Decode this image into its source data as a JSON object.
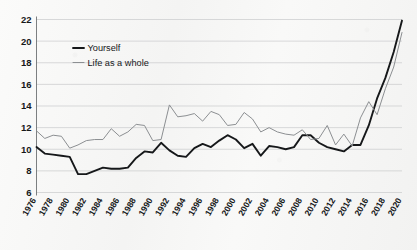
{
  "chart_data": {
    "type": "line",
    "title": "",
    "subtitle": "",
    "xlabel": "",
    "ylabel": "",
    "grid": true,
    "legend_position": "top-left",
    "xlim": [
      1976,
      2020
    ],
    "ylim": [
      6,
      22
    ],
    "yticks": [
      6,
      8,
      10,
      12,
      14,
      16,
      18,
      20,
      22
    ],
    "ytick_labels": [
      "6",
      "8",
      "10",
      "12",
      "14",
      "16",
      "18",
      "20",
      "22"
    ],
    "xticks": [
      1976,
      1978,
      1980,
      1982,
      1984,
      1986,
      1988,
      1990,
      1992,
      1994,
      1996,
      1998,
      2000,
      2002,
      2004,
      2006,
      2008,
      2010,
      2012,
      2014,
      2016,
      2018,
      2020
    ],
    "xtick_labels": [
      "1976",
      "1978",
      "1980",
      "1982",
      "1984",
      "1986",
      "1988",
      "1990",
      "1992",
      "1994",
      "1996",
      "1998",
      "2000",
      "2002",
      "2004",
      "2006",
      "2008",
      "2010",
      "2012",
      "2014",
      "2016",
      "2018",
      "2020"
    ],
    "x": [
      1976,
      1977,
      1978,
      1979,
      1980,
      1981,
      1982,
      1983,
      1984,
      1985,
      1986,
      1987,
      1988,
      1989,
      1990,
      1991,
      1992,
      1993,
      1994,
      1995,
      1996,
      1997,
      1998,
      1999,
      2000,
      2001,
      2002,
      2003,
      2004,
      2005,
      2006,
      2007,
      2008,
      2009,
      2010,
      2011,
      2012,
      2013,
      2014,
      2015,
      2016,
      2017,
      2018,
      2019,
      2020
    ],
    "series": [
      {
        "name": "Yourself",
        "color": "#16181a",
        "width": 1.9,
        "values": [
          10.2,
          9.6,
          9.5,
          9.4,
          9.3,
          7.7,
          7.7,
          8.0,
          8.3,
          8.2,
          8.2,
          8.3,
          9.2,
          9.8,
          9.7,
          10.6,
          9.9,
          9.4,
          9.3,
          10.1,
          10.5,
          10.2,
          10.8,
          11.3,
          10.9,
          10.1,
          10.5,
          9.4,
          10.3,
          10.2,
          10.0,
          10.2,
          11.3,
          11.3,
          10.6,
          10.2,
          10.0,
          9.8,
          10.4,
          10.4,
          12.2,
          14.7,
          16.6,
          19.0,
          21.9
        ]
      },
      {
        "name": "Life as a whole",
        "color": "#8c8f92",
        "width": 1.0,
        "values": [
          11.7,
          11.0,
          11.3,
          11.2,
          10.1,
          10.4,
          10.8,
          10.9,
          10.9,
          11.9,
          11.2,
          11.6,
          12.3,
          12.2,
          10.8,
          10.9,
          14.1,
          13.0,
          13.1,
          13.3,
          12.6,
          13.5,
          13.2,
          12.2,
          12.3,
          13.4,
          12.8,
          11.6,
          12.0,
          11.6,
          11.4,
          11.3,
          11.8,
          10.9,
          11.0,
          12.2,
          10.4,
          11.4,
          10.3,
          12.9,
          14.4,
          13.2,
          15.6,
          17.6,
          20.8
        ]
      }
    ]
  },
  "legend": {
    "entries": [
      {
        "label": "Yourself"
      },
      {
        "label": "Life as a whole"
      }
    ]
  }
}
